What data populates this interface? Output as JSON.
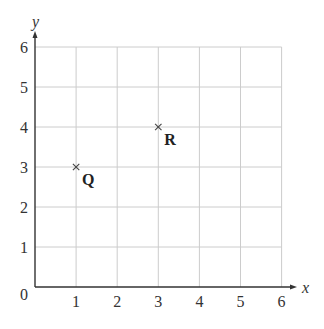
{
  "chart_data": {
    "type": "scatter",
    "title": "",
    "xlabel": "x",
    "ylabel": "y",
    "xlim": [
      0,
      6
    ],
    "ylim": [
      0,
      6
    ],
    "grid": true,
    "x_ticks": [
      "1",
      "2",
      "3",
      "4",
      "5",
      "6"
    ],
    "y_ticks": [
      "1",
      "2",
      "3",
      "4",
      "5",
      "6"
    ],
    "origin_label": "0",
    "points": [
      {
        "label": "Q",
        "x": 1,
        "y": 3,
        "marker": "×"
      },
      {
        "label": "R",
        "x": 3,
        "y": 4,
        "marker": "×"
      }
    ],
    "colors": {
      "grid": "#cccccc",
      "axis": "#333333",
      "marker": "#444444"
    }
  }
}
